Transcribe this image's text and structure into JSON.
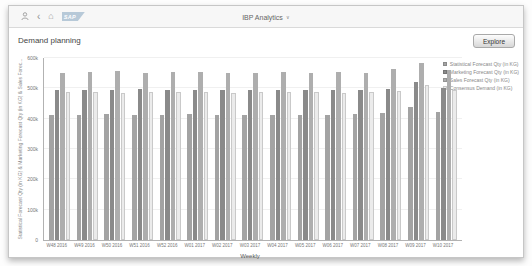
{
  "shell": {
    "app_title": "IBP Analytics",
    "dropdown_glyph": "∨",
    "back_glyph": "‹",
    "home_glyph": "⌂",
    "sap_logo_text": "SAP"
  },
  "page": {
    "title": "Demand planning",
    "explore_button": "Explore"
  },
  "chart_data": {
    "type": "bar",
    "title": "",
    "xlabel": "Weekly",
    "ylabel": "Statistical Forecast Qty (in KG) & Marketing Forecast Qty (in KG) & Sales Forec...",
    "ylim": [
      0,
      600000
    ],
    "ytick_labels": [
      "0",
      "100k",
      "200k",
      "300k",
      "400k",
      "500k",
      "600k"
    ],
    "grid": true,
    "legend_position": "top-right",
    "categories": [
      "W48 2016",
      "W49 2016",
      "W50 2016",
      "W51 2016",
      "W52 2016",
      "W01 2017",
      "W02 2017",
      "W03 2017",
      "W04 2017",
      "W05 2017",
      "W06 2017",
      "W07 2017",
      "W08 2017",
      "W09 2017",
      "W10 2017"
    ],
    "series": [
      {
        "name": "Statistical Forecast Qty (in KG)",
        "color": "#a3a3a3",
        "values": [
          413000,
          411000,
          414000,
          412000,
          411000,
          414000,
          412000,
          413000,
          411000,
          413000,
          412000,
          415000,
          418000,
          440000,
          421000
        ]
      },
      {
        "name": "Marketing Forecast Qty (in KG)",
        "color": "#8a8a8a",
        "values": [
          494000,
          496000,
          493000,
          497000,
          495000,
          496000,
          493000,
          495000,
          496000,
          494000,
          495000,
          496000,
          498000,
          521000,
          500000
        ]
      },
      {
        "name": "Sales Forecast Qty (in KG)",
        "color": "#aeaeae",
        "values": [
          551000,
          553000,
          556000,
          552000,
          554000,
          553000,
          550000,
          552000,
          555000,
          551000,
          553000,
          550000,
          565000,
          584000,
          561000
        ]
      },
      {
        "name": "Consensus Demand (in KG)",
        "color": "#ebebeb",
        "border_color": "#c9c9c9",
        "values": [
          487000,
          489000,
          486000,
          488000,
          487000,
          489000,
          486000,
          488000,
          487000,
          489000,
          486000,
          488000,
          491000,
          511000,
          494000
        ]
      }
    ]
  }
}
